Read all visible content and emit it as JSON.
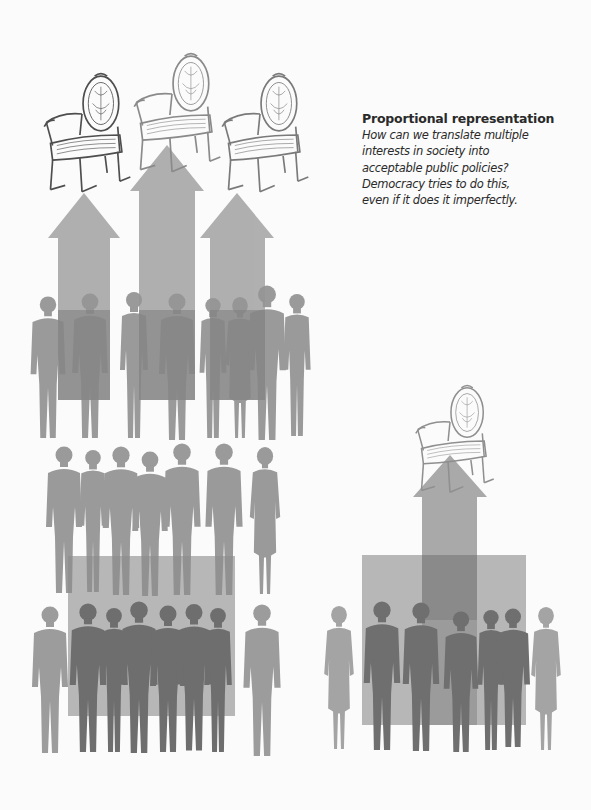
{
  "caption": {
    "title": "Proportional representation",
    "lines": [
      "How can we translate multiple",
      "interests in society into",
      "acceptable public policies?",
      "Democracy tries to do this,",
      "even if it does it imperfectly."
    ]
  },
  "illustration": {
    "left_panel": {
      "description": "Three groups of people silhouettes, each with an upward arrow leading to its own chair",
      "chairs": 3,
      "arrows": 3,
      "people_rows": 3
    },
    "right_panel": {
      "description": "One group of people with a single arrow leading to one chair",
      "chairs": 1,
      "arrows": 1,
      "people_rows": 1
    },
    "colors": {
      "background": "#fbfbfb",
      "arrow": "#a9a9a9",
      "silhouette_light": "#9d9d9d",
      "silhouette_dark": "#6f6f6f",
      "overlay_rect": "#9a9a9a",
      "chair_ink": "#5a5a5a",
      "text": "#2a2a2a"
    }
  }
}
